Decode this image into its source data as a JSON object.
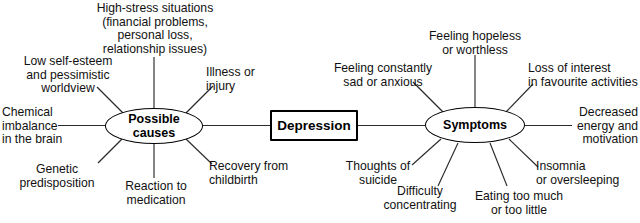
{
  "diagram": {
    "type": "mind-map",
    "title": "Depression",
    "center": {
      "label": "Depression"
    },
    "branches": [
      {
        "id": "possible-causes",
        "label": "Possible\ncauses",
        "side": "left",
        "leaves": [
          {
            "id": "high-stress-situations",
            "text": "High-stress situations\n(financial problems,\npersonal loss,\nrelationship issues)"
          },
          {
            "id": "low-self-esteem",
            "text": "Low self-esteem\nand pessimistic\nworldview"
          },
          {
            "id": "chemical-imbalance",
            "text": "Chemical\nimbalance\nin the brain"
          },
          {
            "id": "genetic-predisposition",
            "text": "Genetic\npredisposition"
          },
          {
            "id": "reaction-to-medication",
            "text": "Reaction to\nmedication"
          },
          {
            "id": "recovery-from-childbirth",
            "text": "Recovery from\nchildbirth"
          },
          {
            "id": "illness-or-injury",
            "text": "Illness or\ninjury"
          }
        ]
      },
      {
        "id": "symptoms",
        "label": "Symptoms",
        "side": "right",
        "leaves": [
          {
            "id": "feeling-hopeless",
            "text": "Feeling hopeless\nor worthless"
          },
          {
            "id": "feeling-sad-anxious",
            "text": "Feeling constantly\nsad or anxious"
          },
          {
            "id": "loss-of-interest",
            "text": "Loss of interest\nin favourite activities"
          },
          {
            "id": "decreased-energy",
            "text": "Decreased\nenergy and\nmotivation"
          },
          {
            "id": "thoughts-of-suicide",
            "text": "Thoughts of\nsuicide"
          },
          {
            "id": "difficulty-concentrating",
            "text": "Difficulty\nconcentrating"
          },
          {
            "id": "eating-too-much",
            "text": "Eating too much\nor too little"
          },
          {
            "id": "insomnia-oversleeping",
            "text": "Insomnia\nor oversleeping"
          }
        ]
      }
    ],
    "colors": {
      "stroke": "#2b2b2b",
      "node_border": "#000000",
      "text": "#111111",
      "background": "#ffffff"
    }
  }
}
